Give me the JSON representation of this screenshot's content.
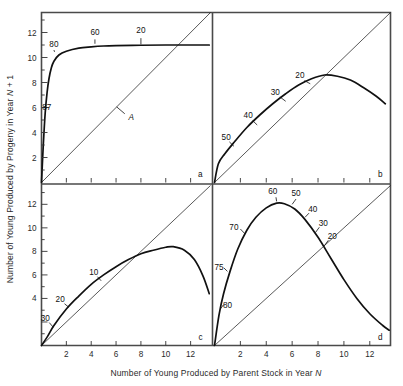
{
  "figure": {
    "xlabel_pre": "Number of Young Produced by Parent Stock in Year ",
    "xlabel_var": "N",
    "ylabel_pre": "Number of Young Produced by Progeny in Year ",
    "ylabel_var": "N",
    "ylabel_post": " + 1"
  },
  "axes": {
    "xticks": [
      "2",
      "4",
      "6",
      "8",
      "10",
      "12"
    ],
    "yticks_top": [
      "2",
      "4",
      "6",
      "8",
      "10",
      "12"
    ],
    "yticks_bottom": [
      "4",
      "6",
      "8",
      "10",
      "12"
    ]
  },
  "panels": {
    "a": "a",
    "b": "b",
    "c": "c",
    "d": "d"
  },
  "replacement_line_label": "A",
  "chart_data": {
    "type": "line",
    "title": "",
    "xlabel": "Number of Young Produced by Parent Stock in Year N",
    "ylabel": "Number of Young Produced by Progeny in Year N + 1",
    "xlim": [
      0,
      13.6
    ],
    "ylim": [
      0,
      13.6
    ],
    "grid": false,
    "legend": "none",
    "panel_count": 4,
    "panel_layout": "2x2",
    "shared_axes": true,
    "annotation_note": "Numbers along each curve are mortality-rate labels with small leader ticks; the straight diagonal in each panel is the replacement line (labelled A in panel a).",
    "panels": [
      {
        "id": "a",
        "label": "a",
        "xticks": [
          2,
          4,
          6,
          8,
          10,
          12
        ],
        "yticks": [
          2,
          4,
          6,
          8,
          10,
          12
        ],
        "has_y_tick_labels": true,
        "diagonal_label": "A",
        "description": "Very steep rise then flat asymptote near 11",
        "points": [
          {
            "x": 0.0,
            "y": 0.0
          },
          {
            "x": 0.15,
            "y": 3.1
          },
          {
            "x": 0.3,
            "y": 5.6
          },
          {
            "x": 0.45,
            "y": 7.2
          },
          {
            "x": 0.6,
            "y": 8.3
          },
          {
            "x": 0.8,
            "y": 9.2
          },
          {
            "x": 1.0,
            "y": 9.7
          },
          {
            "x": 1.4,
            "y": 10.2
          },
          {
            "x": 2.0,
            "y": 10.5
          },
          {
            "x": 3.0,
            "y": 10.75
          },
          {
            "x": 4.0,
            "y": 10.85
          },
          {
            "x": 5.0,
            "y": 10.92
          },
          {
            "x": 6.0,
            "y": 10.95
          },
          {
            "x": 8.0,
            "y": 10.98
          },
          {
            "x": 10.0,
            "y": 11.0
          },
          {
            "x": 12.0,
            "y": 11.0
          },
          {
            "x": 13.5,
            "y": 11.0
          }
        ],
        "curve_labels": [
          {
            "text": "87",
            "x": 0.42,
            "y": 6.0
          },
          {
            "text": "80",
            "x": 1.0,
            "y": 11.0
          },
          {
            "text": "60",
            "x": 4.3,
            "y": 12.0
          },
          {
            "text": "20",
            "x": 8.0,
            "y": 12.1
          }
        ]
      },
      {
        "id": "b",
        "label": "b",
        "xticks": [
          2,
          4,
          6,
          8,
          10,
          12
        ],
        "has_y_tick_labels": false,
        "description": "Broad shallow dome peaking at about x=8.5, y=8.6, just above the replacement line",
        "points": [
          {
            "x": 0.0,
            "y": 0.0
          },
          {
            "x": 0.3,
            "y": 1.5
          },
          {
            "x": 0.8,
            "y": 2.3
          },
          {
            "x": 1.5,
            "y": 3.2
          },
          {
            "x": 2.5,
            "y": 4.4
          },
          {
            "x": 3.5,
            "y": 5.4
          },
          {
            "x": 4.5,
            "y": 6.3
          },
          {
            "x": 5.5,
            "y": 7.1
          },
          {
            "x": 6.5,
            "y": 7.8
          },
          {
            "x": 7.5,
            "y": 8.3
          },
          {
            "x": 8.5,
            "y": 8.6
          },
          {
            "x": 9.5,
            "y": 8.5
          },
          {
            "x": 10.5,
            "y": 8.2
          },
          {
            "x": 11.5,
            "y": 7.6
          },
          {
            "x": 12.5,
            "y": 6.9
          },
          {
            "x": 13.2,
            "y": 6.3
          }
        ],
        "curve_labels": [
          {
            "text": "50",
            "x": 0.9,
            "y": 3.6
          },
          {
            "text": "40",
            "x": 2.6,
            "y": 5.3
          },
          {
            "text": "30",
            "x": 4.7,
            "y": 7.2
          },
          {
            "text": "20",
            "x": 6.6,
            "y": 8.5
          }
        ]
      },
      {
        "id": "c",
        "label": "c",
        "xticks": [
          2,
          4,
          6,
          8,
          10,
          12
        ],
        "yticks": [
          4,
          6,
          8,
          10,
          12
        ],
        "has_y_tick_labels": true,
        "description": "Rises close to the replacement line, peaks near x=10.5 at y=8.4, then falls steeply",
        "points": [
          {
            "x": 0.0,
            "y": 0.0
          },
          {
            "x": 0.5,
            "y": 0.8
          },
          {
            "x": 1.0,
            "y": 1.7
          },
          {
            "x": 2.0,
            "y": 3.1
          },
          {
            "x": 3.0,
            "y": 4.2
          },
          {
            "x": 4.0,
            "y": 5.2
          },
          {
            "x": 5.0,
            "y": 6.0
          },
          {
            "x": 6.0,
            "y": 6.7
          },
          {
            "x": 7.0,
            "y": 7.3
          },
          {
            "x": 8.0,
            "y": 7.8
          },
          {
            "x": 9.0,
            "y": 8.1
          },
          {
            "x": 10.0,
            "y": 8.35
          },
          {
            "x": 10.6,
            "y": 8.4
          },
          {
            "x": 11.5,
            "y": 8.1
          },
          {
            "x": 12.3,
            "y": 7.3
          },
          {
            "x": 13.0,
            "y": 5.9
          },
          {
            "x": 13.5,
            "y": 4.4
          }
        ],
        "curve_labels": [
          {
            "text": "30",
            "x": 0.3,
            "y": 2.3
          },
          {
            "text": "20",
            "x": 1.5,
            "y": 3.9
          },
          {
            "text": "10",
            "x": 4.2,
            "y": 6.2
          }
        ]
      },
      {
        "id": "d",
        "label": "d",
        "xticks": [
          2,
          4,
          6,
          8,
          10,
          12
        ],
        "has_y_tick_labels": false,
        "description": "Sharp dome peaking at about x=5, y=12.1, then decaying toward zero at the right edge",
        "points": [
          {
            "x": 0.0,
            "y": 0.0
          },
          {
            "x": 0.35,
            "y": 2.6
          },
          {
            "x": 0.7,
            "y": 4.4
          },
          {
            "x": 1.2,
            "y": 6.3
          },
          {
            "x": 1.8,
            "y": 8.2
          },
          {
            "x": 2.5,
            "y": 9.8
          },
          {
            "x": 3.2,
            "y": 10.9
          },
          {
            "x": 4.0,
            "y": 11.7
          },
          {
            "x": 4.8,
            "y": 12.1
          },
          {
            "x": 5.4,
            "y": 12.05
          },
          {
            "x": 6.2,
            "y": 11.6
          },
          {
            "x": 7.0,
            "y": 10.7
          },
          {
            "x": 8.0,
            "y": 9.2
          },
          {
            "x": 9.0,
            "y": 7.4
          },
          {
            "x": 10.0,
            "y": 5.6
          },
          {
            "x": 11.0,
            "y": 4.0
          },
          {
            "x": 12.0,
            "y": 2.7
          },
          {
            "x": 13.0,
            "y": 1.7
          },
          {
            "x": 13.5,
            "y": 1.3
          }
        ],
        "curve_labels": [
          {
            "text": "80",
            "x": 1.0,
            "y": 3.4
          },
          {
            "text": "75",
            "x": 0.35,
            "y": 6.6
          },
          {
            "text": "70",
            "x": 1.5,
            "y": 10.0
          },
          {
            "text": "60",
            "x": 4.5,
            "y": 13.1
          },
          {
            "text": "50",
            "x": 6.3,
            "y": 12.9
          },
          {
            "text": "40",
            "x": 7.6,
            "y": 11.5
          },
          {
            "text": "30",
            "x": 8.4,
            "y": 10.3
          },
          {
            "text": "20",
            "x": 9.1,
            "y": 9.2
          }
        ]
      }
    ]
  }
}
